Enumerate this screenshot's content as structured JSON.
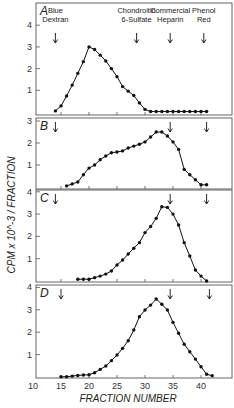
{
  "chart_data": {
    "type": "line",
    "title": "",
    "xlabel": "FRACTION NUMBER",
    "ylabel": "CPM x 10^-3 / FRACTION",
    "x_ticks": [
      10,
      15,
      20,
      25,
      30,
      35,
      40
    ],
    "xlim": [
      10,
      44
    ],
    "grid": false,
    "markers": [
      {
        "label": [
          "Blue",
          "Dextran"
        ],
        "fraction": 14
      },
      {
        "label": [
          "Chondroitin",
          "6-Sulfate"
        ],
        "fraction": 28.5
      },
      {
        "label": [
          "Commercial",
          "Heparin"
        ],
        "fraction": 34.5
      },
      {
        "label": [
          "Phenol",
          "Red"
        ],
        "fraction": 40.5
      }
    ],
    "panels": [
      {
        "label": "A",
        "ylim": [
          0,
          4.8
        ],
        "y_ticks": [
          1,
          2,
          3,
          4
        ],
        "arrows": [
          14,
          28.5,
          34.5,
          40.5
        ],
        "x": [
          14,
          15,
          16,
          17,
          18,
          19,
          20,
          21,
          22,
          23,
          24,
          25,
          26,
          27,
          28,
          29,
          30,
          31,
          32,
          33,
          34,
          35,
          36,
          37,
          38,
          39,
          40,
          41
        ],
        "values": [
          0.05,
          0.28,
          0.74,
          1.24,
          1.78,
          2.32,
          3.0,
          2.88,
          2.62,
          2.35,
          2.0,
          1.63,
          1.17,
          0.96,
          0.76,
          0.42,
          0.12,
          0.02,
          0.02,
          0.02,
          0.02,
          0.02,
          0.02,
          0.02,
          0.02,
          0.02,
          0.02,
          0.02
        ]
      },
      {
        "label": "B",
        "ylim": [
          0,
          3
        ],
        "y_ticks": [
          1,
          2,
          3
        ],
        "arrows": [
          14,
          34.5,
          41
        ],
        "x": [
          16,
          17,
          18,
          19,
          20,
          21,
          22,
          23,
          24,
          25,
          26,
          27,
          28,
          29,
          30,
          31,
          32,
          33,
          34,
          35,
          36,
          37,
          38,
          39,
          40,
          41
        ],
        "values": [
          0.05,
          0.14,
          0.23,
          0.56,
          0.86,
          1.0,
          1.24,
          1.41,
          1.56,
          1.59,
          1.64,
          1.77,
          1.86,
          1.94,
          2.05,
          2.27,
          2.5,
          2.5,
          2.32,
          2.05,
          1.71,
          0.8,
          0.56,
          0.33,
          0.1,
          0.1
        ]
      },
      {
        "label": "C",
        "ylim": [
          0,
          4
        ],
        "y_ticks": [
          1,
          2,
          3,
          4
        ],
        "arrows": [
          14,
          34.5,
          41
        ],
        "x": [
          18,
          19,
          20,
          21,
          22,
          23,
          24,
          25,
          26,
          27,
          28,
          29,
          30,
          31,
          32,
          33,
          34,
          35,
          36,
          37,
          38,
          39,
          40,
          41
        ],
        "values": [
          0.08,
          0.08,
          0.08,
          0.15,
          0.22,
          0.31,
          0.45,
          0.72,
          0.94,
          1.21,
          1.47,
          1.72,
          2.17,
          2.44,
          2.81,
          3.33,
          3.3,
          3.0,
          2.51,
          1.72,
          1.12,
          0.49,
          0.22,
          0.0
        ]
      },
      {
        "label": "D",
        "ylim": [
          0,
          4
        ],
        "y_ticks": [
          1,
          2,
          3,
          4
        ],
        "arrows": [
          15,
          34.5,
          41.5
        ],
        "x": [
          15,
          16,
          17,
          18,
          19,
          20,
          21,
          22,
          23,
          24,
          25,
          26,
          27,
          28,
          29,
          30,
          31,
          32,
          33,
          34,
          35,
          36,
          37,
          38,
          39,
          40,
          41,
          42
        ],
        "values": [
          0.01,
          0.01,
          0.04,
          0.07,
          0.09,
          0.1,
          0.19,
          0.34,
          0.49,
          0.73,
          0.98,
          1.28,
          1.62,
          2.1,
          2.69,
          2.99,
          3.21,
          3.48,
          3.25,
          2.99,
          2.44,
          1.95,
          1.46,
          1.13,
          0.8,
          0.46,
          0.12,
          0.06
        ]
      }
    ]
  }
}
